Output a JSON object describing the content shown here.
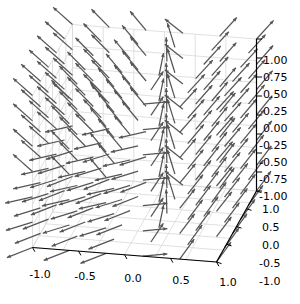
{
  "figure": {
    "name": "matplotlib-3d-quiver-figure",
    "width": 300,
    "height": 304,
    "background_color": "#ffffff",
    "arrow_color": "#555555",
    "grid_color": "#d8d8d8",
    "pane_edge_color": "#cfcfcf",
    "axis_line_color": "#000000",
    "tick_color": "#000000"
  },
  "chart_data": {
    "type": "quiver3d",
    "title": "",
    "xlabel": "",
    "ylabel": "",
    "zlabel": "",
    "grid": true,
    "legend": null,
    "projection": "3d",
    "elev": 18,
    "azim": -55,
    "xlim": [
      -1.2,
      1.2
    ],
    "ylim": [
      -1.2,
      1.2
    ],
    "zlim": [
      -1.0,
      1.0
    ],
    "xticks": [
      -1.0,
      -0.5,
      0.0,
      0.5,
      1.0
    ],
    "xticklabels": [
      "-1.0",
      "-0.5",
      "0.0",
      "0.5",
      "1.0"
    ],
    "yticks": [
      1.0,
      0.5,
      0.0,
      -0.5,
      -1.0
    ],
    "yticklabels": [
      "1.0",
      "0.5",
      "0.0",
      "-0.5",
      "-1.0"
    ],
    "zticks": [
      1.0,
      0.75,
      0.5,
      0.25,
      0.0,
      -0.25,
      -0.5,
      -0.75,
      -1.0
    ],
    "zticklabels": [
      "1.00",
      "0.75",
      "0.50",
      "0.25",
      "0.00",
      "-0.25",
      "-0.50",
      "-0.75",
      "-1.00"
    ],
    "grid_n": [
      6,
      6,
      7
    ],
    "vector_field": "radial-swirl",
    "arrow_count": 252
  },
  "axes": {
    "x": {
      "name": "x-axis",
      "ticklabels": [
        "-1.0",
        "-0.5",
        "0.0",
        "0.5",
        "1.0"
      ],
      "label_positions": [
        [
          40,
          275
        ],
        [
          85,
          277
        ],
        [
          133,
          279
        ],
        [
          181,
          281
        ],
        [
          228,
          283
        ]
      ]
    },
    "y": {
      "name": "y-axis",
      "ticklabels": [
        "1.0",
        "0.5",
        "0.0",
        "-0.5",
        "-1.0"
      ],
      "label_positions": [
        [
          262,
          210
        ],
        [
          262,
          228
        ],
        [
          262,
          246
        ],
        [
          259,
          264
        ],
        [
          259,
          282
        ]
      ]
    },
    "z": {
      "name": "z-axis",
      "ticklabels": [
        "1.00",
        "0.75",
        "0.50",
        "0.25",
        "0.00",
        "-0.25",
        "-0.50",
        "-0.75",
        "-1.00"
      ],
      "label_positions": [
        [
          263,
          61
        ],
        [
          263,
          78
        ],
        [
          263,
          95
        ],
        [
          263,
          112
        ],
        [
          263,
          129
        ],
        [
          259,
          146
        ],
        [
          259,
          163
        ],
        [
          259,
          180
        ],
        [
          259,
          197
        ]
      ]
    }
  }
}
